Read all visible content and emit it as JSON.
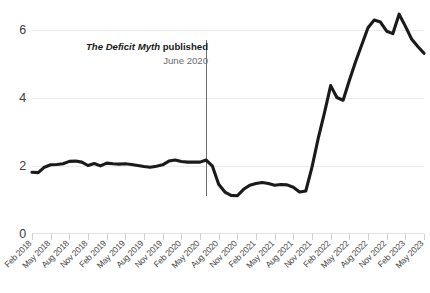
{
  "annotation": {
    "title_emphasis": "The Deficit Myth",
    "title_rest": " published",
    "subtitle": "June 2020"
  },
  "chart_data": {
    "type": "line",
    "title": "",
    "subtitle": "",
    "xlabel": "",
    "ylabel": "",
    "ylim": [
      0,
      6.8
    ],
    "grid": true,
    "gridlines_y": [
      0,
      2,
      4,
      6
    ],
    "legend": "none",
    "y_tick_labels": [
      "6",
      "4",
      "2",
      "0"
    ],
    "x_tick_labels": [
      "Feb 2018",
      "May 2018",
      "Aug 2018",
      "Nov 2018",
      "Feb 2019",
      "May 2019",
      "Aug 2019",
      "Nov 2019",
      "Feb 2020",
      "May 2020",
      "Aug 2020",
      "Nov 2020",
      "Feb 2021",
      "May 2021",
      "Aug 2021",
      "Nov 2021",
      "Feb 2022",
      "May 2022",
      "Aug 2022",
      "Nov 2022",
      "Feb 2023",
      "May 2023"
    ],
    "x_labels_monthly": [
      "Feb 2018",
      "Mar 2018",
      "Apr 2018",
      "May 2018",
      "Jun 2018",
      "Jul 2018",
      "Aug 2018",
      "Sep 2018",
      "Oct 2018",
      "Nov 2018",
      "Dec 2018",
      "Jan 2019",
      "Feb 2019",
      "Mar 2019",
      "Apr 2019",
      "May 2019",
      "Jun 2019",
      "Jul 2019",
      "Aug 2019",
      "Sep 2019",
      "Oct 2019",
      "Nov 2019",
      "Dec 2019",
      "Jan 2020",
      "Feb 2020",
      "Mar 2020",
      "Apr 2020",
      "May 2020",
      "Jun 2020",
      "Jul 2020",
      "Aug 2020",
      "Sep 2020",
      "Oct 2020",
      "Nov 2020",
      "Dec 2020",
      "Jan 2021",
      "Feb 2021",
      "Mar 2021",
      "Apr 2021",
      "May 2021",
      "Jun 2021",
      "Jul 2021",
      "Aug 2021",
      "Sep 2021",
      "Oct 2021",
      "Nov 2021",
      "Dec 2021",
      "Jan 2022",
      "Feb 2022",
      "Mar 2022",
      "Apr 2022",
      "May 2022",
      "Jun 2022",
      "Jul 2022",
      "Aug 2022",
      "Sep 2022",
      "Oct 2022",
      "Nov 2022",
      "Dec 2022",
      "Jan 2023",
      "Feb 2023",
      "Mar 2023",
      "Apr 2023",
      "May 2023"
    ],
    "values": [
      1.8,
      1.79,
      1.95,
      2.02,
      2.03,
      2.05,
      2.12,
      2.13,
      2.1,
      2.0,
      2.06,
      1.99,
      2.07,
      2.05,
      2.04,
      2.05,
      2.03,
      2.0,
      1.97,
      1.95,
      1.98,
      2.02,
      2.13,
      2.16,
      2.12,
      2.1,
      2.1,
      2.1,
      2.16,
      1.98,
      1.45,
      1.22,
      1.12,
      1.11,
      1.3,
      1.42,
      1.47,
      1.5,
      1.47,
      1.42,
      1.44,
      1.43,
      1.36,
      1.22,
      1.25,
      1.95,
      2.8,
      3.55,
      4.35,
      4.0,
      3.92,
      4.5,
      5.05,
      5.55,
      6.05,
      6.28,
      6.22,
      5.95,
      5.88,
      6.45,
      6.1,
      5.72,
      5.5,
      5.3
    ],
    "event_marker": {
      "label": "The Deficit Myth published",
      "date": "June 2020",
      "x_label": "Jun 2020",
      "value_index": 28
    },
    "series": [
      {
        "name": "series-1",
        "color": "#1a1a1a",
        "values": [
          1.8,
          1.79,
          1.95,
          2.02,
          2.03,
          2.05,
          2.12,
          2.13,
          2.1,
          2.0,
          2.06,
          1.99,
          2.07,
          2.05,
          2.04,
          2.05,
          2.03,
          2.0,
          1.97,
          1.95,
          1.98,
          2.02,
          2.13,
          2.16,
          2.12,
          2.1,
          2.1,
          2.1,
          2.16,
          1.98,
          1.45,
          1.22,
          1.12,
          1.11,
          1.3,
          1.42,
          1.47,
          1.5,
          1.47,
          1.42,
          1.44,
          1.43,
          1.36,
          1.22,
          1.25,
          1.95,
          2.8,
          3.55,
          4.35,
          4.0,
          3.92,
          4.5,
          5.05,
          5.55,
          6.05,
          6.28,
          6.22,
          5.95,
          5.88,
          6.45,
          6.1,
          5.72,
          5.5,
          5.3
        ]
      }
    ]
  }
}
